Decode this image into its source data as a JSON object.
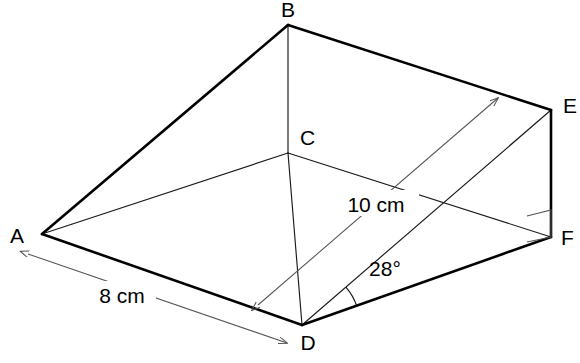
{
  "figure": {
    "background_color": "#ffffff",
    "line_color": "#000000",
    "width": 580,
    "height": 363
  },
  "vertices": [
    {
      "id": "A",
      "label": "A",
      "x": 42,
      "y": 234,
      "label_x": 17,
      "label_y": 243,
      "anchor": "middle"
    },
    {
      "id": "B",
      "label": "B",
      "x": 288,
      "y": 25,
      "label_x": 288,
      "label_y": 17,
      "anchor": "middle"
    },
    {
      "id": "C",
      "label": "C",
      "x": 288,
      "y": 153,
      "label_x": 300,
      "label_y": 145,
      "anchor": "start"
    },
    {
      "id": "D",
      "label": "D",
      "x": 302,
      "y": 325,
      "label_x": 308,
      "label_y": 350,
      "anchor": "middle"
    },
    {
      "id": "E",
      "label": "E",
      "x": 551,
      "y": 110,
      "label_x": 563,
      "label_y": 113,
      "anchor": "start"
    },
    {
      "id": "F",
      "label": "F",
      "x": 551,
      "y": 237,
      "label_x": 561,
      "label_y": 245,
      "anchor": "start"
    }
  ],
  "edges": [
    {
      "id": "AB",
      "from": "A",
      "to": "B",
      "weight": "thick"
    },
    {
      "id": "BE",
      "from": "B",
      "to": "E",
      "weight": "thick"
    },
    {
      "id": "EF",
      "from": "E",
      "to": "F",
      "weight": "thick"
    },
    {
      "id": "DF",
      "from": "D",
      "to": "F",
      "weight": "thick"
    },
    {
      "id": "AD",
      "from": "A",
      "to": "D",
      "weight": "thick"
    },
    {
      "id": "BC",
      "from": "B",
      "to": "C",
      "weight": "thin"
    },
    {
      "id": "AC",
      "from": "A",
      "to": "C",
      "weight": "thin"
    },
    {
      "id": "CD",
      "from": "C",
      "to": "D",
      "weight": "thin"
    },
    {
      "id": "CF",
      "from": "C",
      "to": "F",
      "weight": "thin"
    },
    {
      "id": "DE",
      "from": "D",
      "to": "E",
      "weight": "thin"
    }
  ],
  "dimensions": [
    {
      "id": "len-8cm",
      "label": "8 cm",
      "value": 8,
      "unit": "cm",
      "describes": "AD",
      "x1": 28,
      "y1": 254,
      "x2": 287,
      "y2": 343,
      "arrow_start": true,
      "arrow_end": true,
      "label_x": 122,
      "label_y": 303,
      "label_w": 68,
      "label_h": 26
    },
    {
      "id": "len-10cm",
      "label": "10 cm",
      "value": 10,
      "unit": "cm",
      "describes": "slant face width",
      "x1": 258,
      "y1": 305,
      "x2": 498,
      "y2": 98,
      "arrow_start": true,
      "arrow_end": true,
      "label_x": 376,
      "label_y": 212,
      "label_w": 86,
      "label_h": 26
    }
  ],
  "angles": [
    {
      "id": "angle-28",
      "label": "28°",
      "value": 28,
      "unit": "degrees",
      "vertex": "D",
      "between": [
        "DE",
        "DF"
      ],
      "radius": 58,
      "label_x": 385,
      "label_y": 276
    }
  ],
  "markers": [
    {
      "id": "right-angle-F",
      "type": "right-angle-square",
      "at": "F",
      "points": "527,216 551,210 551,237 527,242"
    }
  ]
}
